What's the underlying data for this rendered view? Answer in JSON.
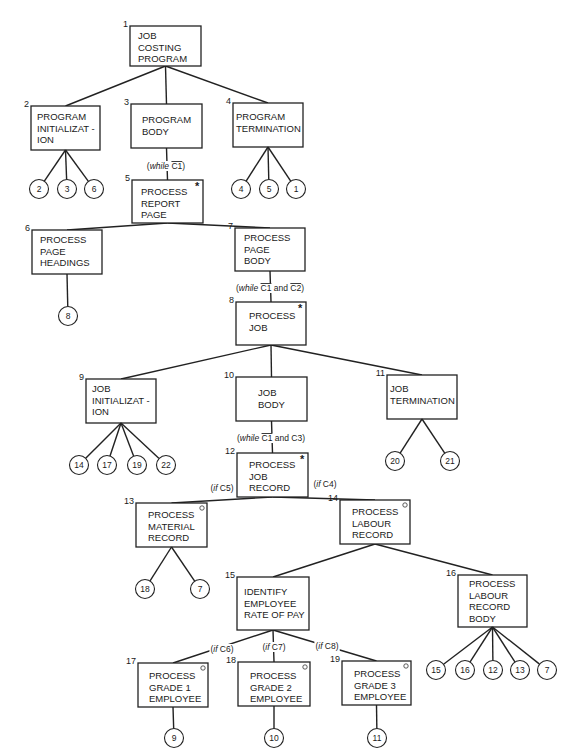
{
  "nodes": [
    {
      "id": "1",
      "lines": [
        "JOB",
        "COSTING",
        "PROGRAM"
      ],
      "marker": ""
    },
    {
      "id": "2",
      "lines": [
        "PROGRAM",
        "INITIALIZAT -",
        "ION"
      ],
      "marker": ""
    },
    {
      "id": "3",
      "lines": [
        "PROGRAM",
        "BODY"
      ],
      "marker": ""
    },
    {
      "id": "4",
      "lines": [
        "PROGRAM",
        "TERMINATION"
      ],
      "marker": ""
    },
    {
      "id": "5",
      "lines": [
        "PROCESS",
        "REPORT",
        "PAGE"
      ],
      "marker": "iteration"
    },
    {
      "id": "6",
      "lines": [
        "PROCESS",
        "PAGE",
        "HEADINGS"
      ],
      "marker": ""
    },
    {
      "id": "7",
      "lines": [
        "PROCESS",
        "PAGE",
        "BODY"
      ],
      "marker": ""
    },
    {
      "id": "8",
      "lines": [
        "PROCESS",
        "JOB"
      ],
      "marker": "iteration"
    },
    {
      "id": "9",
      "lines": [
        "JOB",
        "INITIALIZAT -",
        "ION"
      ],
      "marker": ""
    },
    {
      "id": "10",
      "lines": [
        "JOB",
        "BODY"
      ],
      "marker": ""
    },
    {
      "id": "11",
      "lines": [
        "JOB",
        "TERMINATION"
      ],
      "marker": ""
    },
    {
      "id": "12",
      "lines": [
        "PROCESS",
        "JOB",
        "RECORD"
      ],
      "marker": "iteration"
    },
    {
      "id": "13",
      "lines": [
        "PROCESS",
        "MATERIAL",
        "RECORD"
      ],
      "marker": "selection"
    },
    {
      "id": "14",
      "lines": [
        "PROCESS",
        "LABOUR",
        "RECORD"
      ],
      "marker": "selection"
    },
    {
      "id": "15",
      "lines": [
        "IDENTIFY",
        "EMPLOYEE",
        "RATE OF PAY"
      ],
      "marker": ""
    },
    {
      "id": "16",
      "lines": [
        "PROCESS",
        "LABOUR",
        "RECORD",
        "BODY"
      ],
      "marker": ""
    },
    {
      "id": "17",
      "lines": [
        "PROCESS",
        "GRADE 1",
        "EMPLOYEE"
      ],
      "marker": "selection"
    },
    {
      "id": "18",
      "lines": [
        "PROCESS",
        "GRADE 2",
        "EMPLOYEE"
      ],
      "marker": "selection"
    },
    {
      "id": "19",
      "lines": [
        "PROCESS",
        "GRADE 3",
        "EMPLOYEE"
      ],
      "marker": "selection"
    }
  ],
  "markers": {
    "iteration": "*",
    "selection": "○"
  },
  "conditions": {
    "c3_5": {
      "prefix": "(",
      "kw": "while",
      "parts": [
        {
          "t": "C1",
          "bar": true
        }
      ],
      "suffix": ")"
    },
    "c7_8": {
      "prefix": "(",
      "kw": "while",
      "parts": [
        {
          "t": "C1",
          "bar": true
        },
        {
          "t": " and ",
          "bar": false
        },
        {
          "t": "C2",
          "bar": true
        }
      ],
      "suffix": ")"
    },
    "c10_12": {
      "prefix": "(",
      "kw": "while",
      "parts": [
        {
          "t": "C1",
          "bar": true
        },
        {
          "t": " and C3",
          "bar": false
        }
      ],
      "suffix": ")"
    },
    "c12_13": {
      "prefix": "(",
      "kw": "if",
      "parts": [
        {
          "t": " C5",
          "bar": false
        }
      ],
      "suffix": ")"
    },
    "c12_14": {
      "prefix": "(",
      "kw": "if",
      "parts": [
        {
          "t": " C4",
          "bar": false
        }
      ],
      "suffix": ")"
    },
    "c15_17": {
      "prefix": "(",
      "kw": "if",
      "parts": [
        {
          "t": " C6",
          "bar": false
        }
      ],
      "suffix": ")"
    },
    "c15_18": {
      "prefix": "(",
      "kw": "if",
      "parts": [
        {
          "t": " C7",
          "bar": false
        }
      ],
      "suffix": ")"
    },
    "c15_19": {
      "prefix": "(",
      "kw": "if",
      "parts": [
        {
          "t": " C8",
          "bar": false
        }
      ],
      "suffix": ")"
    }
  },
  "operation_refs": {
    "2": [
      "2",
      "3",
      "6"
    ],
    "4": [
      "4",
      "5",
      "1"
    ],
    "6": [
      "8"
    ],
    "9": [
      "14",
      "17",
      "19",
      "22"
    ],
    "11": [
      "20",
      "21"
    ],
    "13": [
      "18",
      "7"
    ],
    "16": [
      "15",
      "16",
      "12",
      "13",
      "7"
    ],
    "17": [
      "9"
    ],
    "18": [
      "10"
    ],
    "19": [
      "11"
    ]
  },
  "edges": [
    [
      "1",
      "2"
    ],
    [
      "1",
      "3"
    ],
    [
      "1",
      "4"
    ],
    [
      "3",
      "5"
    ],
    [
      "5",
      "6"
    ],
    [
      "5",
      "7"
    ],
    [
      "7",
      "8"
    ],
    [
      "8",
      "9"
    ],
    [
      "8",
      "10"
    ],
    [
      "8",
      "11"
    ],
    [
      "10",
      "12"
    ],
    [
      "12",
      "13"
    ],
    [
      "12",
      "14"
    ],
    [
      "14",
      "15"
    ],
    [
      "14",
      "16"
    ],
    [
      "15",
      "17"
    ],
    [
      "15",
      "18"
    ],
    [
      "15",
      "19"
    ]
  ]
}
